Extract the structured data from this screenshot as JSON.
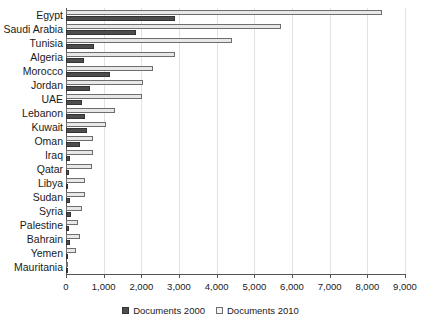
{
  "chart_data": {
    "type": "bar",
    "title": "",
    "xlabel": "",
    "ylabel": "",
    "orientation": "horizontal",
    "xlim": [
      0,
      9000
    ],
    "xticks": [
      "0",
      "1,000",
      "2,000",
      "3,000",
      "4,000",
      "5,000",
      "6,000",
      "7,000",
      "8,000",
      "9,000"
    ],
    "xtick_values": [
      0,
      1000,
      2000,
      3000,
      4000,
      5000,
      6000,
      7000,
      8000,
      9000
    ],
    "grid": "vertical",
    "legend_position": "bottom",
    "categories": [
      "Egypt",
      "Saudi Arabia",
      "Tunisia",
      "Algeria",
      "Morocco",
      "Jordan",
      "UAE",
      "Lebanon",
      "Kuwait",
      "Oman",
      "Iraq",
      "Qatar",
      "Libya",
      "Sudan",
      "Syria",
      "Palestine",
      "Bahrain",
      "Yemen",
      "Mauritania"
    ],
    "series": [
      {
        "name": "Documents 2000",
        "color": "#4d4d4d",
        "values": [
          2900,
          1850,
          750,
          480,
          1170,
          640,
          430,
          510,
          560,
          370,
          110,
          80,
          60,
          110,
          140,
          80,
          110,
          50,
          15
        ]
      },
      {
        "name": "Documents 2010",
        "color": "#e8e8e8",
        "values": [
          8400,
          5700,
          4400,
          2900,
          2300,
          2050,
          2020,
          1300,
          1060,
          720,
          720,
          690,
          500,
          500,
          430,
          320,
          370,
          270,
          20
        ]
      }
    ]
  },
  "legend": {
    "items": [
      {
        "label": "Documents 2000"
      },
      {
        "label": "Documents 2010"
      }
    ]
  }
}
